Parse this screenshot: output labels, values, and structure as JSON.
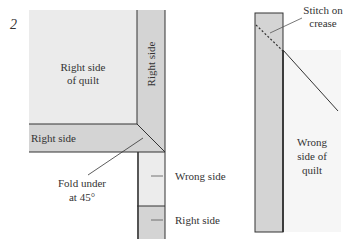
{
  "figure": {
    "step_number": "2",
    "left": {
      "quilt_label_line1": "Right side",
      "quilt_label_line2": "of quilt",
      "vertical_binding_label": "Right side",
      "horizontal_binding_label": "Right side",
      "fold_label_line1": "Fold under",
      "fold_label_line2": "at 45°",
      "wrong_side_label": "Wrong side",
      "lower_right_side_label": "Right side"
    },
    "right": {
      "stitch_label_line1": "Stitch on",
      "stitch_label_line2": "crease",
      "quilt_label_line1": "Wrong",
      "quilt_label_line2": "side of",
      "quilt_label_line3": "quilt"
    }
  },
  "colors": {
    "quilt_fill": "#ebebeb",
    "binding_fill": "#d4d4d4",
    "wrong_side_fill": "#ececec",
    "stroke": "#333333",
    "background": "#ffffff"
  }
}
